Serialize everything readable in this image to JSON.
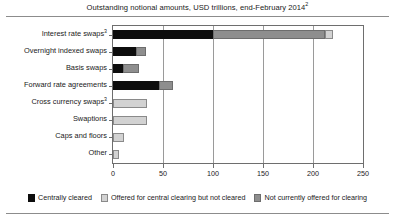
{
  "chart_data": {
    "type": "bar",
    "orientation": "horizontal",
    "stacked": true,
    "title": "Outstanding notional amounts, USD trillions, end-February 2014",
    "title_superscript": "2",
    "xlabel": "",
    "ylabel": "",
    "xlim": [
      0,
      250
    ],
    "xticks": [
      0,
      50,
      100,
      150,
      200,
      250
    ],
    "xticklabels": [
      "0",
      "50",
      "100",
      "150",
      "200",
      "250"
    ],
    "grid": "vertical",
    "legend_position": "bottom",
    "categories": [
      "Interest rate swaps",
      "Overnight indexed swaps",
      "Basis swaps",
      "Forward rate agreements",
      "Cross currency swaps",
      "Swaptions",
      "Caps and floors",
      "Other"
    ],
    "category_superscripts": [
      "3",
      "",
      "",
      "",
      "3",
      "",
      "",
      ""
    ],
    "series": [
      {
        "name": "Centrally cleared",
        "color": "#0d0d0d",
        "values": [
          100,
          23,
          10,
          46,
          0,
          0,
          0,
          0
        ]
      },
      {
        "name": "Not currently offered for clearing",
        "color": "#8e8e8e",
        "values": [
          112,
          10,
          16,
          14,
          0,
          0,
          0,
          0
        ]
      },
      {
        "name": "Offered for central clearing but not cleared",
        "color": "#d2d2d2",
        "values": [
          8,
          0,
          0,
          0,
          34,
          34,
          11,
          6
        ]
      }
    ],
    "totals": [
      220,
      33,
      26,
      60,
      34,
      34,
      11,
      6
    ]
  },
  "legend": {
    "items": [
      {
        "label": "Centrally cleared",
        "swatch": "cleared"
      },
      {
        "label": "Offered for central clearing but not cleared",
        "swatch": "offered"
      },
      {
        "label": "Not currently offered for clearing",
        "swatch": "notoffered"
      }
    ]
  }
}
